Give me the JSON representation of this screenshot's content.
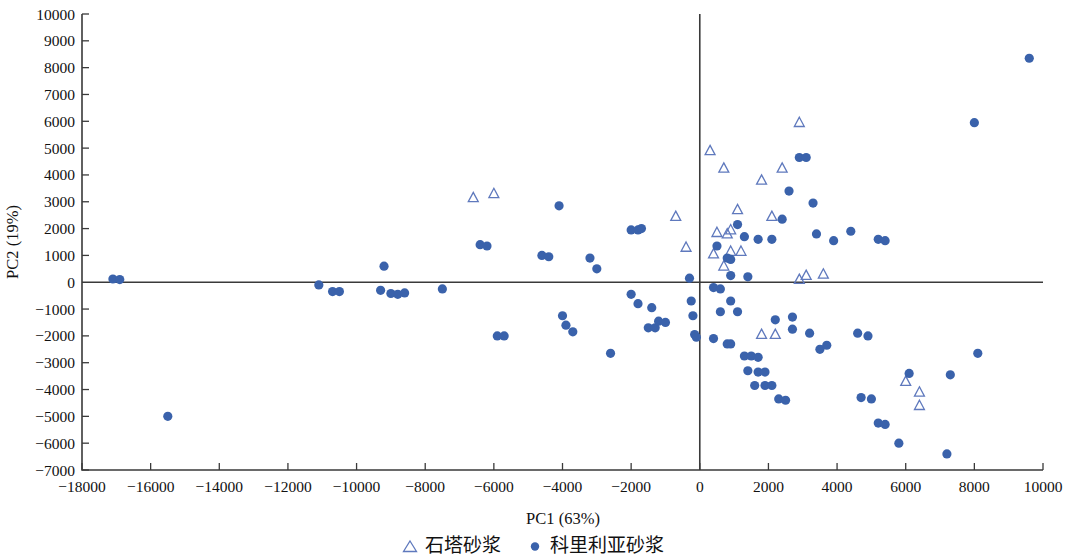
{
  "chart_data": {
    "type": "scatter",
    "title": "",
    "xlabel": "PC1 (63%)",
    "ylabel": "PC2 (19%)",
    "xlim": [
      -18000,
      10000
    ],
    "ylim": [
      -7000,
      10000
    ],
    "xticks": [
      -18000,
      -16000,
      -14000,
      -12000,
      -10000,
      -8000,
      -6000,
      -4000,
      -2000,
      0,
      2000,
      4000,
      6000,
      8000,
      10000
    ],
    "yticks": [
      -7000,
      -6000,
      -5000,
      -4000,
      -3000,
      -2000,
      -1000,
      0,
      1000,
      2000,
      3000,
      4000,
      5000,
      6000,
      7000,
      8000,
      9000,
      10000
    ],
    "xtick_labels": [
      "-18000",
      "-16000",
      "-14000",
      "-12000",
      "-10000",
      "-8000",
      "-6000",
      "-4000",
      "-2000",
      "0",
      "2000",
      "4000",
      "6000",
      "8000",
      "10000"
    ],
    "ytick_labels": [
      "-7000",
      "-6000",
      "-5000",
      "-4000",
      "-3000",
      "-2000",
      "-1000",
      "0",
      "1000",
      "2000",
      "3000",
      "4000",
      "5000",
      "6000",
      "7000",
      "8000",
      "9000",
      "10000"
    ],
    "grid": false,
    "origin_axes": true,
    "legend_position": "bottom-center",
    "marker_color": "#3a62ab",
    "series": [
      {
        "name": "石塔砂浆",
        "marker": "triangle",
        "fill": "none",
        "stroke": "#5f79bd",
        "points": [
          [
            -6600,
            3150
          ],
          [
            -6000,
            3300
          ],
          [
            -700,
            2450
          ],
          [
            -400,
            1300
          ],
          [
            300,
            4900
          ],
          [
            700,
            4250
          ],
          [
            500,
            1850
          ],
          [
            800,
            1800
          ],
          [
            900,
            1950
          ],
          [
            400,
            1050
          ],
          [
            900,
            1150
          ],
          [
            1200,
            1150
          ],
          [
            700,
            600
          ],
          [
            1100,
            2700
          ],
          [
            2100,
            2450
          ],
          [
            1800,
            3800
          ],
          [
            2400,
            4250
          ],
          [
            2900,
            5950
          ],
          [
            3100,
            250
          ],
          [
            3600,
            300
          ],
          [
            2900,
            100
          ],
          [
            1800,
            -1950
          ],
          [
            2200,
            -1950
          ],
          [
            6000,
            -3700
          ],
          [
            6400,
            -4100
          ],
          [
            6400,
            -4600
          ]
        ]
      },
      {
        "name": "科里利亚砂浆",
        "marker": "circle",
        "fill": "#3a62ab",
        "points": [
          [
            -17100,
            120
          ],
          [
            -16900,
            100
          ],
          [
            -15500,
            -5000
          ],
          [
            -11100,
            -100
          ],
          [
            -10700,
            -350
          ],
          [
            -10500,
            -350
          ],
          [
            -9300,
            -300
          ],
          [
            -9000,
            -420
          ],
          [
            -8800,
            -450
          ],
          [
            -8600,
            -400
          ],
          [
            -9200,
            600
          ],
          [
            -7500,
            -250
          ],
          [
            -6400,
            1400
          ],
          [
            -6200,
            1350
          ],
          [
            -5900,
            -2000
          ],
          [
            -5700,
            -2000
          ],
          [
            -4600,
            1000
          ],
          [
            -4400,
            950
          ],
          [
            -4100,
            2850
          ],
          [
            -4000,
            -1250
          ],
          [
            -3900,
            -1600
          ],
          [
            -3700,
            -1850
          ],
          [
            -3200,
            900
          ],
          [
            -3000,
            500
          ],
          [
            -2600,
            -2650
          ],
          [
            -2000,
            1950
          ],
          [
            -1800,
            1950
          ],
          [
            -1700,
            2000
          ],
          [
            -2000,
            -450
          ],
          [
            -1800,
            -800
          ],
          [
            -1400,
            -950
          ],
          [
            -1500,
            -1700
          ],
          [
            -1300,
            -1700
          ],
          [
            -1200,
            -1450
          ],
          [
            -1000,
            -1500
          ],
          [
            -300,
            150
          ],
          [
            -250,
            -700
          ],
          [
            -200,
            -1250
          ],
          [
            -150,
            -1950
          ],
          [
            -100,
            -2050
          ],
          [
            400,
            -200
          ],
          [
            600,
            -250
          ],
          [
            900,
            -700
          ],
          [
            500,
            1350
          ],
          [
            800,
            900
          ],
          [
            900,
            850
          ],
          [
            1100,
            2150
          ],
          [
            1300,
            1700
          ],
          [
            900,
            250
          ],
          [
            1400,
            200
          ],
          [
            600,
            -1100
          ],
          [
            1100,
            -1100
          ],
          [
            400,
            -2100
          ],
          [
            800,
            -2300
          ],
          [
            900,
            -2300
          ],
          [
            1300,
            -2750
          ],
          [
            1500,
            -2750
          ],
          [
            1700,
            -2800
          ],
          [
            1400,
            -3300
          ],
          [
            1700,
            -3350
          ],
          [
            1900,
            -3350
          ],
          [
            1600,
            -3850
          ],
          [
            1900,
            -3850
          ],
          [
            2100,
            -3850
          ],
          [
            2300,
            -4350
          ],
          [
            2500,
            -4400
          ],
          [
            2200,
            -1400
          ],
          [
            2700,
            -1300
          ],
          [
            1700,
            1600
          ],
          [
            2100,
            1600
          ],
          [
            2400,
            2350
          ],
          [
            2600,
            3400
          ],
          [
            2900,
            4650
          ],
          [
            3100,
            4650
          ],
          [
            2700,
            -1750
          ],
          [
            3200,
            -1900
          ],
          [
            3500,
            -2500
          ],
          [
            3700,
            -2350
          ],
          [
            3400,
            1800
          ],
          [
            3900,
            1550
          ],
          [
            3300,
            2950
          ],
          [
            4400,
            1900
          ],
          [
            4600,
            -1900
          ],
          [
            4900,
            -2000
          ],
          [
            5200,
            1600
          ],
          [
            5400,
            1550
          ],
          [
            4700,
            -4300
          ],
          [
            5000,
            -4350
          ],
          [
            5200,
            -5250
          ],
          [
            5400,
            -5300
          ],
          [
            5800,
            -6000
          ],
          [
            6100,
            -3400
          ],
          [
            7200,
            -6400
          ],
          [
            7300,
            -3450
          ],
          [
            8100,
            -2650
          ],
          [
            8000,
            5950
          ],
          [
            9600,
            8350
          ]
        ]
      }
    ]
  },
  "legend": {
    "entries": [
      {
        "label": "石塔砂浆",
        "marker": "triangle"
      },
      {
        "label": "科里利亚砂浆",
        "marker": "circle"
      }
    ]
  }
}
